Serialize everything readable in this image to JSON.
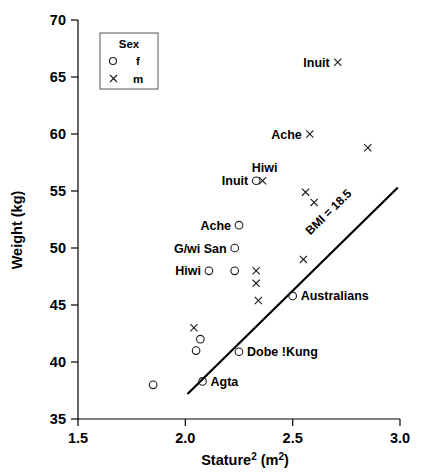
{
  "chart_data": {
    "type": "scatter",
    "title": "",
    "xlabel": "Stature² (m²)",
    "ylabel": "Weight (kg)",
    "xlim": [
      1.5,
      3.0
    ],
    "ylim": [
      35,
      70
    ],
    "xticks": [
      "1.5",
      "2.0",
      "2.5",
      "3.0"
    ],
    "xtick_values": [
      1.5,
      2.0,
      2.5,
      3.0
    ],
    "yticks": [
      "35",
      "40",
      "45",
      "50",
      "55",
      "60",
      "65",
      "70"
    ],
    "ytick_values": [
      35,
      40,
      45,
      50,
      55,
      60,
      65,
      70
    ],
    "grid": false,
    "legend": {
      "title": "Sex",
      "position": "top-left",
      "entries": [
        {
          "marker": "circle-open",
          "label": "f"
        },
        {
          "marker": "cross",
          "label": "m"
        }
      ]
    },
    "series": [
      {
        "name": "f",
        "marker": "circle-open",
        "points": [
          {
            "x": 2.33,
            "y": 55.9,
            "label": "Inuit",
            "label_pos": "left"
          },
          {
            "x": 2.25,
            "y": 52.0,
            "label": "Ache",
            "label_pos": "left"
          },
          {
            "x": 2.23,
            "y": 50.0,
            "label": "G/wi San",
            "label_pos": "left"
          },
          {
            "x": 2.11,
            "y": 48.0,
            "label": "Hiwi",
            "label_pos": "left"
          },
          {
            "x": 2.23,
            "y": 48.0,
            "label": "",
            "label_pos": ""
          },
          {
            "x": 2.5,
            "y": 45.8,
            "label": "Australians",
            "label_pos": "right"
          },
          {
            "x": 2.07,
            "y": 42.0,
            "label": "",
            "label_pos": ""
          },
          {
            "x": 2.05,
            "y": 41.0,
            "label": "",
            "label_pos": ""
          },
          {
            "x": 2.25,
            "y": 40.9,
            "label": "Dobe !Kung",
            "label_pos": "right"
          },
          {
            "x": 2.08,
            "y": 38.3,
            "label": "Agta",
            "label_pos": "right"
          },
          {
            "x": 1.85,
            "y": 38.0,
            "label": "",
            "label_pos": ""
          }
        ]
      },
      {
        "name": "m",
        "marker": "cross",
        "points": [
          {
            "x": 2.71,
            "y": 66.3,
            "label": "Inuit",
            "label_pos": "left"
          },
          {
            "x": 2.58,
            "y": 60.0,
            "label": "Ache",
            "label_pos": "left"
          },
          {
            "x": 2.85,
            "y": 58.8,
            "label": "",
            "label_pos": ""
          },
          {
            "x": 2.36,
            "y": 55.9,
            "label": "Hiwi",
            "label_pos": "above"
          },
          {
            "x": 2.56,
            "y": 54.9,
            "label": "",
            "label_pos": ""
          },
          {
            "x": 2.6,
            "y": 54.0,
            "label": "",
            "label_pos": ""
          },
          {
            "x": 2.55,
            "y": 49.0,
            "label": "",
            "label_pos": ""
          },
          {
            "x": 2.33,
            "y": 48.0,
            "label": "",
            "label_pos": ""
          },
          {
            "x": 2.33,
            "y": 46.9,
            "label": "",
            "label_pos": ""
          },
          {
            "x": 2.34,
            "y": 45.4,
            "label": "",
            "label_pos": ""
          },
          {
            "x": 2.04,
            "y": 43.0,
            "label": "",
            "label_pos": ""
          }
        ]
      }
    ],
    "annotations": [
      {
        "type": "line",
        "name": "bmi-reference-line",
        "label": "BMI = 18.5",
        "slope": 18.5,
        "x_start": 2.01,
        "y_start": 37.2,
        "x_end": 2.99,
        "y_end": 55.3
      }
    ]
  }
}
